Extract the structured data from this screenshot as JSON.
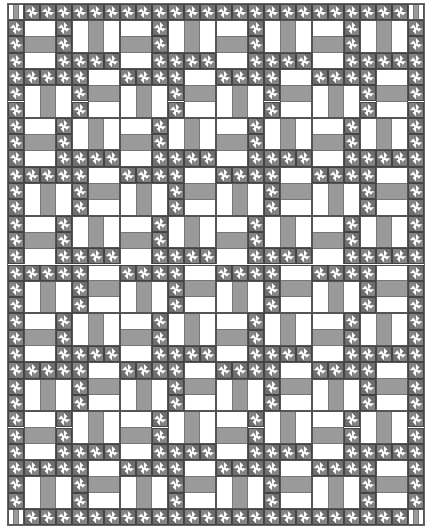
{
  "colors": {
    "white": "#ffffff",
    "rail_gray": "#9a9a9a",
    "pinwheel_dark": "#6e6e6e",
    "pinwheel_mid": "#b0b0b0",
    "outline": "#555555"
  },
  "layout": {
    "unit_w": 16,
    "unit_h": 16.3,
    "interior_cols": 24,
    "interior_rows": 30,
    "border_units": 1,
    "tile_size": 6
  },
  "tile": {
    "rails": [
      {
        "orient": "h",
        "col": 0,
        "row": 0,
        "w": 2,
        "h": 3
      },
      {
        "orient": "v",
        "col": 3,
        "row": 0,
        "w": 3,
        "h": 2
      },
      {
        "orient": "h",
        "col": 4,
        "row": 3,
        "w": 2,
        "h": 3
      },
      {
        "orient": "v",
        "col": 0,
        "row": 4,
        "w": 3,
        "h": 2
      }
    ],
    "pinwheels": [
      [
        2,
        0
      ],
      [
        2,
        1
      ],
      [
        2,
        2
      ],
      [
        3,
        2
      ],
      [
        4,
        2
      ],
      [
        5,
        2
      ],
      [
        0,
        3
      ],
      [
        1,
        3
      ],
      [
        2,
        3
      ],
      [
        3,
        3
      ],
      [
        3,
        4
      ],
      [
        3,
        5
      ]
    ]
  },
  "border": {
    "corner_stripes": [
      "w",
      "g",
      "w"
    ],
    "edge_block": "pinwheel"
  },
  "rail_stripes": [
    "w",
    "g",
    "w"
  ]
}
